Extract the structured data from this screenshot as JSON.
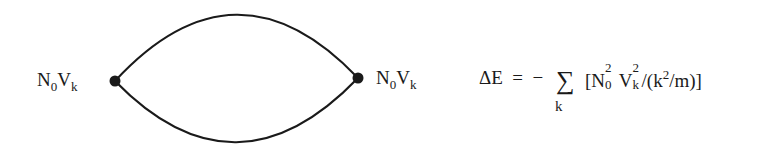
{
  "diagram": {
    "type": "feynman-bubble",
    "vertices": [
      {
        "id": "left",
        "x": 115,
        "y": 81,
        "label_main": "N",
        "label_sub0": "0",
        "label_main2": "V",
        "label_sub2": "k"
      },
      {
        "id": "right",
        "x": 358,
        "y": 78,
        "label_main": "N",
        "label_sub0": "0",
        "label_main2": "V",
        "label_sub2": "k"
      }
    ],
    "edges": [
      {
        "from": "left",
        "to": "right",
        "shape": "upper-arc"
      },
      {
        "from": "left",
        "to": "right",
        "shape": "lower-arc"
      }
    ],
    "line_color": "#1a1a1a"
  },
  "equation": {
    "lhs": "ΔE",
    "equals": "=",
    "sign": "−",
    "sum_symbol": "∑",
    "sum_index": "k",
    "open_bracket": "[",
    "N": "N",
    "N_sup": "2",
    "N_sub": "0",
    "V": "V",
    "V_sup": "2",
    "V_sub": "k",
    "slash": "/",
    "open_paren": "(",
    "k": "k",
    "k_sup": "2",
    "per_m": "/m)",
    "close_bracket": "]"
  }
}
